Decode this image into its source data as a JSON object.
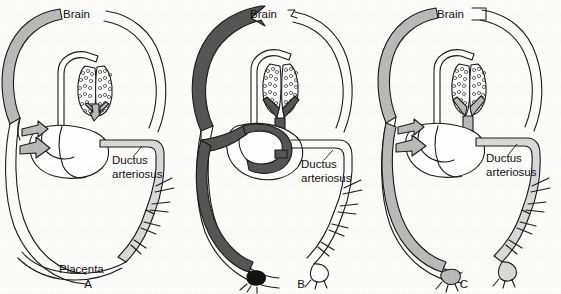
{
  "figure": {
    "background_color": "#fbfbfa",
    "stroke_color": "#1a1a1a",
    "panel_count": 3
  },
  "colors": {
    "vessel_outline": "#1a1a1a",
    "white_vessel": "#ffffff",
    "light_gray": "#d8d8d8",
    "medium_gray": "#b9b9b9",
    "dark_gray": "#555555",
    "black_fill": "#111111",
    "lung_stipple": "#4a4a4a"
  },
  "panels": [
    {
      "id": "A",
      "letter": "A",
      "name": "fetal-circulation",
      "labels": {
        "brain": "Brain",
        "ductus_line1": "Ductus",
        "ductus_line2": "arteriosus",
        "placenta": "Placenta"
      },
      "vessel_shading": {
        "brain_loop_left": "medium_gray",
        "brain_loop_right": "white_vessel",
        "descending_aorta": "light_gray",
        "umbilical": "white_vessel",
        "heart_arrows": "medium_gray"
      },
      "has_placenta": true,
      "has_umbilical_clamp": false
    },
    {
      "id": "B",
      "letter": "B",
      "name": "transitional-circulation",
      "labels": {
        "brain": "Brain",
        "ductus_line1": "Ductus",
        "ductus_line2": "arteriosus"
      },
      "vessel_shading": {
        "brain_loop_left": "dark_gray",
        "brain_loop_right": "white_vessel",
        "descending_aorta": "white_vessel",
        "umbilical": "dark_gray",
        "heart_arrows": "dark_gray"
      },
      "has_placenta": false,
      "has_umbilical_clamp": true
    },
    {
      "id": "C",
      "letter": "C",
      "name": "neonatal-circulation",
      "labels": {
        "brain": "Brain",
        "ductus_line1": "Ductus",
        "ductus_line2": "arteriosus"
      },
      "vessel_shading": {
        "brain_loop_left": "medium_gray",
        "brain_loop_right": "white_vessel",
        "descending_aorta": "light_gray",
        "umbilical": "medium_gray",
        "heart_arrows": "medium_gray"
      },
      "has_placenta": false,
      "has_umbilical_clamp": false
    }
  ]
}
